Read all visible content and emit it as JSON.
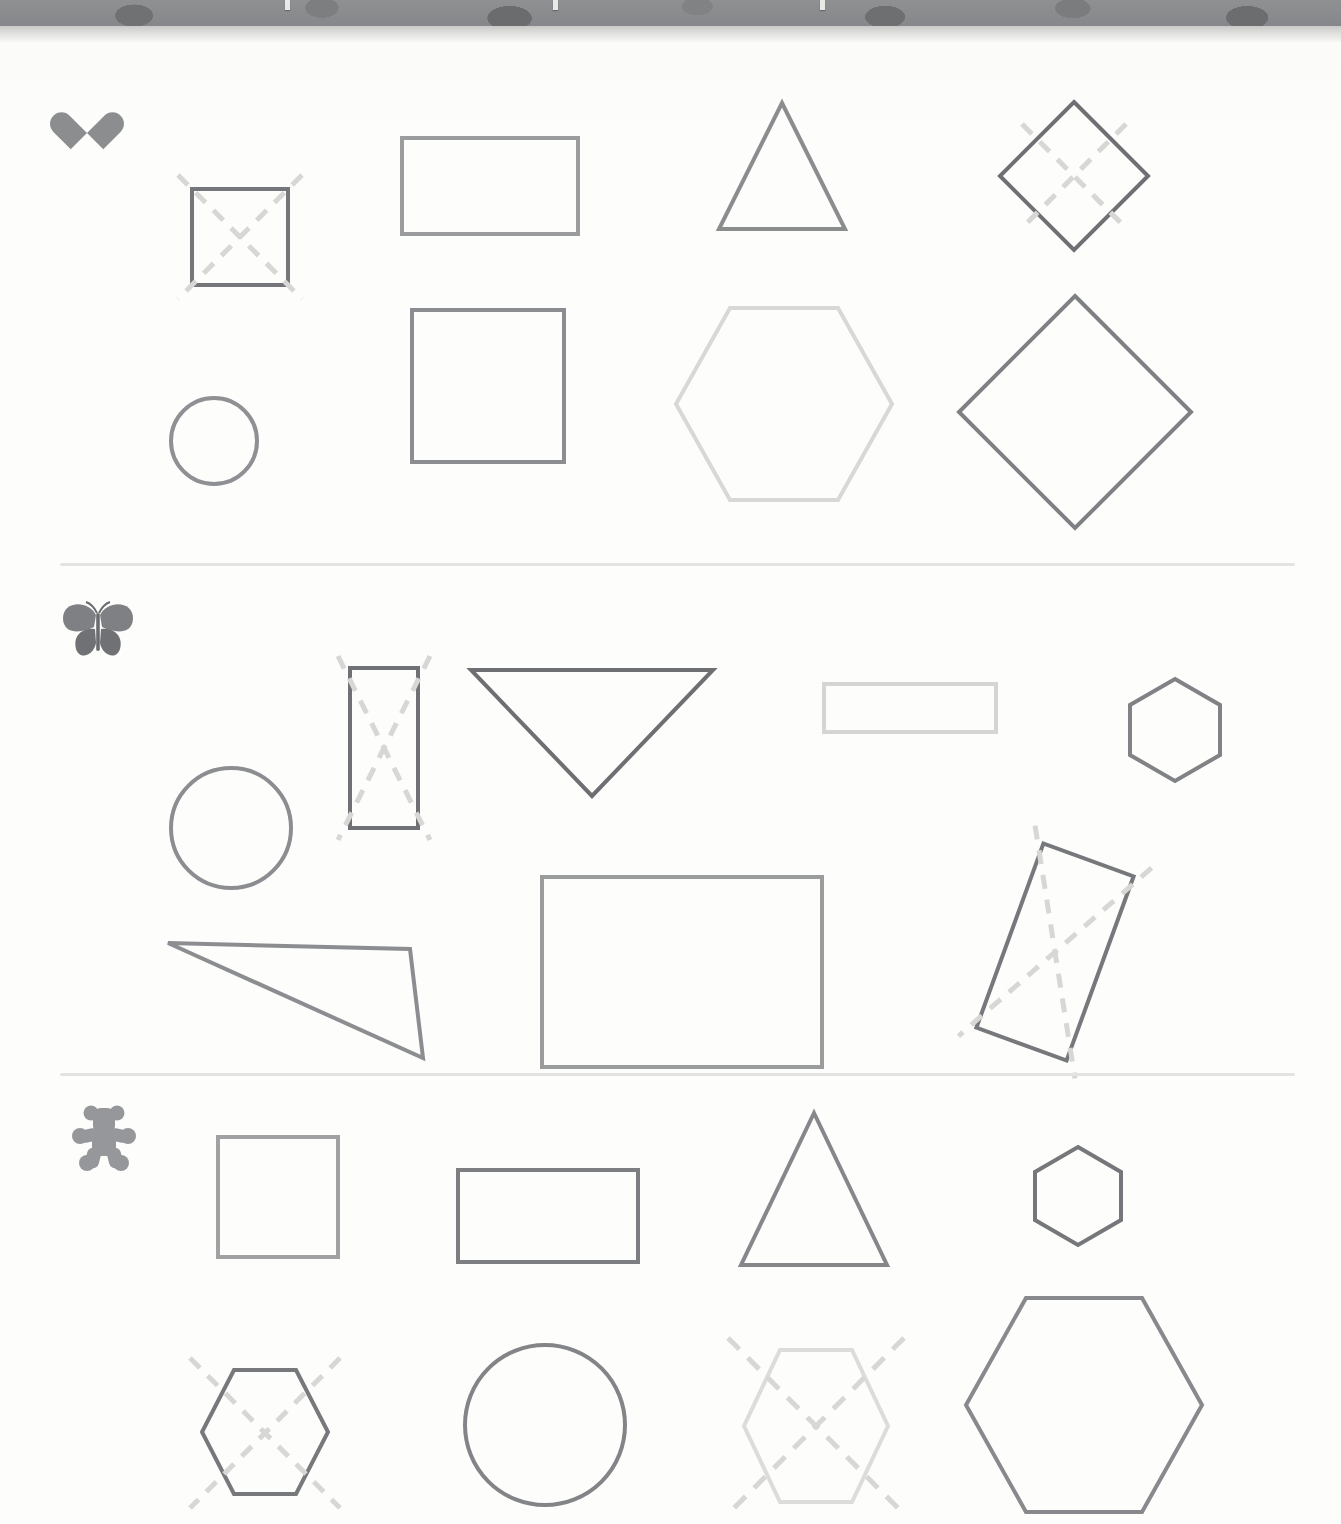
{
  "page": {
    "type": "geometry-shapes-worksheet",
    "background_color": "#fdfdfc",
    "top_band": {
      "name": "patterned-binder-band",
      "color": "#85878a",
      "clip_count": 3
    },
    "divider_color": "#e3e3e1",
    "divider_positions_y": [
      521,
      1031
    ]
  },
  "rows": [
    {
      "id": "row-heart",
      "icon": "heart-icon",
      "icon_label": "heart",
      "icon_color": "#8b8d8f",
      "shapes": [
        {
          "name": "square-small-crossed",
          "type": "square",
          "stroke": "#74767a",
          "stroke_width": 4,
          "marked": true,
          "mark": "dashed-x"
        },
        {
          "name": "rectangle-wide",
          "type": "rectangle",
          "stroke": "#9a9c9e",
          "stroke_width": 4,
          "marked": false
        },
        {
          "name": "triangle-up",
          "type": "triangle",
          "stroke": "#8a8c8e",
          "stroke_width": 4,
          "marked": false
        },
        {
          "name": "diamond-small-crossed",
          "type": "diamond",
          "stroke": "#6e7073",
          "stroke_width": 4,
          "marked": true,
          "mark": "dashed-x"
        },
        {
          "name": "circle-small",
          "type": "circle",
          "stroke": "#8e9093",
          "stroke_width": 4,
          "marked": false
        },
        {
          "name": "square-medium",
          "type": "square",
          "stroke": "#8b8d90",
          "stroke_width": 4,
          "marked": false
        },
        {
          "name": "hexagon-large-light",
          "type": "hexagon",
          "stroke": "#d8d9d7",
          "stroke_width": 4,
          "marked": false
        },
        {
          "name": "diamond-large",
          "type": "diamond",
          "stroke": "#7e8083",
          "stroke_width": 4,
          "marked": false
        }
      ]
    },
    {
      "id": "row-butterfly",
      "icon": "butterfly-icon",
      "icon_label": "butterfly",
      "icon_color": "#7e8083",
      "shapes": [
        {
          "name": "circle-medium",
          "type": "circle",
          "stroke": "#8b8d90",
          "stroke_width": 4,
          "marked": false
        },
        {
          "name": "rectangle-vertical-crossed",
          "type": "rectangle",
          "stroke": "#6f7174",
          "stroke_width": 4,
          "marked": true,
          "mark": "dashed-x"
        },
        {
          "name": "triangle-down",
          "type": "triangle",
          "stroke": "#6d6f72",
          "stroke_width": 4,
          "marked": false
        },
        {
          "name": "rectangle-thin-light",
          "type": "rectangle",
          "stroke": "#d5d6d4",
          "stroke_width": 4,
          "marked": false
        },
        {
          "name": "hexagon-small",
          "type": "hexagon",
          "stroke": "#808285",
          "stroke_width": 4,
          "marked": false
        },
        {
          "name": "triangle-scalene",
          "type": "triangle",
          "stroke": "#8b8d90",
          "stroke_width": 4,
          "marked": false
        },
        {
          "name": "rectangle-large",
          "type": "rectangle",
          "stroke": "#9a9c9e",
          "stroke_width": 4,
          "marked": false
        },
        {
          "name": "rectangle-tilted-crossed",
          "type": "rectangle",
          "stroke": "#76787b",
          "stroke_width": 4,
          "marked": true,
          "mark": "dashed-x",
          "rotation_deg": 20
        }
      ]
    },
    {
      "id": "row-bear",
      "icon": "teddy-bear-icon",
      "icon_label": "teddy bear",
      "icon_color": "#95979a",
      "shapes": [
        {
          "name": "square-light",
          "type": "square",
          "stroke": "#9fa1a3",
          "stroke_width": 4,
          "marked": false
        },
        {
          "name": "rectangle-medium",
          "type": "rectangle",
          "stroke": "#7c7e81",
          "stroke_width": 4,
          "marked": false
        },
        {
          "name": "triangle-up-tall",
          "type": "triangle",
          "stroke": "#85878a",
          "stroke_width": 4,
          "marked": false
        },
        {
          "name": "hexagon-small-dark",
          "type": "hexagon",
          "stroke": "#75777a",
          "stroke_width": 4,
          "marked": false
        },
        {
          "name": "hexagon-crossed",
          "type": "hexagon",
          "stroke": "#76787b",
          "stroke_width": 4,
          "marked": true,
          "mark": "dashed-x"
        },
        {
          "name": "circle-large",
          "type": "circle",
          "stroke": "#828487",
          "stroke_width": 4,
          "marked": false
        },
        {
          "name": "hexagon-light-crossed",
          "type": "hexagon",
          "stroke": "#dcdddb",
          "stroke_width": 4,
          "marked": true,
          "mark": "dashed-x"
        },
        {
          "name": "hexagon-large",
          "type": "hexagon",
          "stroke": "#87898c",
          "stroke_width": 4,
          "marked": false
        }
      ]
    }
  ],
  "mark_style": {
    "name": "dashed-x",
    "color": "#d7d8d6",
    "stroke_width": 5,
    "dash": "14 11"
  }
}
